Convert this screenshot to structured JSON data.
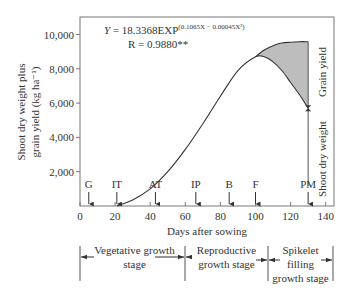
{
  "chart_data": {
    "type": "line",
    "title": "",
    "xlabel": "Days after sowing",
    "ylabel": "Shoot dry weight plus grain yield (kg ha⁻¹)",
    "ylabel_line1": "Shoot dry weight plus",
    "ylabel_line2": "grain yield (kg ha⁻¹)",
    "xlim": [
      0,
      140
    ],
    "ylim": [
      0,
      10000
    ],
    "x_ticks": [
      0,
      20,
      40,
      60,
      80,
      100,
      120,
      140
    ],
    "x_tick_labels": [
      "0",
      "20",
      "40",
      "60",
      "80",
      "100",
      "120",
      "140"
    ],
    "y_ticks": [
      2000,
      4000,
      6000,
      8000,
      10000
    ],
    "y_tick_labels": [
      "2,000",
      "4,000",
      "6,000",
      "8,000",
      "10,000"
    ],
    "equation": {
      "main": "Y = 18.3368EXP",
      "exponent": "(0.1065X − 0.00045X²)",
      "r": "R = 0.9880**"
    },
    "series": [
      {
        "name": "Shoot dry weight",
        "x": [
          21,
          30,
          40,
          50,
          60,
          70,
          80,
          90,
          100,
          105,
          110,
          115,
          120,
          125,
          130
        ],
        "values": [
          0,
          350,
          1000,
          2000,
          3300,
          4800,
          6400,
          7900,
          8700,
          8700,
          8400,
          7900,
          7200,
          6500,
          5700
        ]
      },
      {
        "name": "Shoot dry weight plus grain yield",
        "x": [
          100,
          105,
          110,
          115,
          120,
          125,
          130
        ],
        "values": [
          8700,
          9100,
          9350,
          9500,
          9550,
          9580,
          9580
        ]
      }
    ],
    "shaded_region": {
      "label": "Grain yield",
      "between_days": [
        100,
        130
      ],
      "fill": "#bdbdbd"
    },
    "right_labels": {
      "upper": "Grain yield",
      "lower": "Shoot dry weight"
    },
    "markers": [
      {
        "label": "G",
        "day": 5
      },
      {
        "label": "IT",
        "day": 21
      },
      {
        "label": "AT",
        "day": 43
      },
      {
        "label": "IP",
        "day": 66
      },
      {
        "label": "B",
        "day": 85
      },
      {
        "label": "F",
        "day": 100
      },
      {
        "label": "PM",
        "day": 130
      }
    ],
    "stages": [
      {
        "label_line1": "Vegetative growth",
        "label_line2": "stage",
        "label_line3": "",
        "start_day": 0,
        "end_day": 60
      },
      {
        "label_line1": "Reproductive",
        "label_line2": "growth stage",
        "label_line3": "",
        "start_day": 60,
        "end_day": 107
      },
      {
        "label_line1": "Spikelet",
        "label_line2": "filling",
        "label_line3": "growth stage",
        "start_day": 107,
        "end_day": 144
      }
    ],
    "grid": false,
    "legend": "none"
  }
}
